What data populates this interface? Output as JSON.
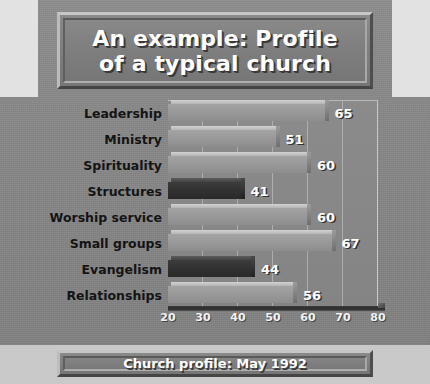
{
  "slide": {
    "title": "An example: Profile\nof a typical church",
    "footer": "Church profile: May 1992",
    "background_color": "#878787",
    "plate_color": "#7e7e7e",
    "title_text_color": "#ffffff"
  },
  "chart_data": {
    "type": "bar",
    "orientation": "horizontal",
    "title": "An example: Profile of a typical church",
    "subtitle": "Church profile: May 1992",
    "xlabel": "",
    "ylabel": "",
    "xlim": [
      20,
      80
    ],
    "xticks": [
      20,
      30,
      40,
      50,
      60,
      70,
      80
    ],
    "grid": true,
    "grid_axis": "x",
    "legend": false,
    "categories": [
      "Leadership",
      "Ministry",
      "Spirituality",
      "Structures",
      "Worship service",
      "Small groups",
      "Evangelism",
      "Relationships"
    ],
    "values": [
      65,
      51,
      60,
      41,
      60,
      67,
      44,
      56
    ],
    "bar_colors": [
      "#9a9a9a",
      "#9a9a9a",
      "#9a9a9a",
      "#323232",
      "#9a9a9a",
      "#9a9a9a",
      "#323232",
      "#9a9a9a"
    ],
    "highlight_categories": [
      "Structures",
      "Evangelism"
    ],
    "value_label_color": "#ffffff"
  }
}
